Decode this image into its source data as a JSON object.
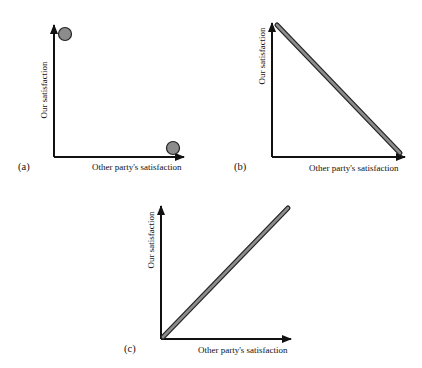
{
  "panels": [
    {
      "id": "a",
      "label": "(a)",
      "x_axis_label": "Other party's satisfaction",
      "y_axis_label": "Our satisfaction",
      "description": "Two outcomes: high ours/low theirs and low ours/high theirs"
    },
    {
      "id": "b",
      "label": "(b)",
      "x_axis_label": "Other party's satisfaction",
      "y_axis_label": "Our satisfaction",
      "description": "Negative-sum trade-off line"
    },
    {
      "id": "c",
      "label": "(c)",
      "x_axis_label": "Other party's satisfaction",
      "y_axis_label": "Our satisfaction",
      "description": "Positive joint-gain line"
    }
  ],
  "colors": {
    "axis": "#111111",
    "fill": "#8c8c8c",
    "outline": "#222222"
  }
}
